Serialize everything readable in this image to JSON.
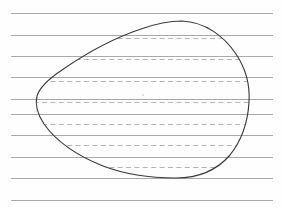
{
  "document": {
    "title": "Lined paper with hand-drawn closed blob shape",
    "kind": "scanned-drawing",
    "background_color": "#fefefe",
    "width": 282,
    "height": 209
  },
  "paper": {
    "name": "ruled-paper",
    "line_color": "#a9a9ad",
    "line_left_x": 11,
    "line_right_x": 273,
    "line_count": 10,
    "line_spacing": 21.4,
    "line_y_positions": [
      13,
      35,
      56,
      77,
      99,
      114,
      135,
      157,
      178,
      200
    ]
  },
  "hatching": {
    "name": "interior-dashed-lines",
    "color": "#b4b4b8",
    "dash_pattern": "5 3.4",
    "offset_below_rule": 3,
    "row_y_positions": [
      38,
      59,
      81,
      102,
      124,
      145,
      167
    ],
    "count": 7
  },
  "shape": {
    "name": "closed-blob",
    "stroke_color": "#3a3a3c",
    "stroke_width": 1.15,
    "fill": "none",
    "extremes": {
      "top": {
        "x": 182,
        "y": 21
      },
      "bottom": {
        "x": 176,
        "y": 178
      },
      "left": {
        "x": 37,
        "y": 96
      },
      "right": {
        "x": 249,
        "y": 104
      }
    },
    "path": "M 182 21 C 205 22 224 36 236 54 C 246 69 250 87 249 102 C 248 120 242 140 230 155 C 217 170 198 178 176 178 C 150 178 124 174 103 166 C 78 156 56 141 44 124 C 36 112 35 104 37 96 C 40 86 50 78 62 70 C 85 54 114 38 141 29 C 155 24 169 21 182 21 Z"
  },
  "marks": [
    {
      "name": "faint-speck-upper",
      "x": 143,
      "y": 95,
      "r": 1.2
    },
    {
      "name": "faint-speck-lower",
      "x": 36,
      "y": 111,
      "r": 1.0
    }
  ]
}
